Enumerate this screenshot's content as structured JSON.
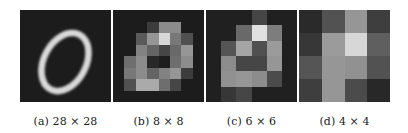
{
  "figure": {
    "panels": [
      {
        "id": "a",
        "caption": "(a) 28 × 28",
        "resolution": "28 × 28",
        "description": "Handwritten digit zero (MNIST-style) at full resolution"
      },
      {
        "id": "b",
        "caption": "(b) 8 × 8",
        "resolution": "8 × 8",
        "grid": [
          [
            28,
            28,
            28,
            28,
            28,
            28,
            28,
            28
          ],
          [
            28,
            28,
            28,
            60,
            140,
            140,
            28,
            28
          ],
          [
            28,
            28,
            90,
            150,
            215,
            120,
            80,
            28
          ],
          [
            28,
            28,
            130,
            100,
            70,
            105,
            150,
            28
          ],
          [
            28,
            110,
            140,
            40,
            30,
            110,
            140,
            28
          ],
          [
            28,
            120,
            140,
            100,
            130,
            150,
            60,
            28
          ],
          [
            28,
            80,
            170,
            170,
            110,
            70,
            28,
            28
          ],
          [
            28,
            28,
            28,
            28,
            28,
            28,
            28,
            28
          ]
        ]
      },
      {
        "id": "c",
        "caption": "(c) 6 × 6",
        "resolution": "6 × 6",
        "grid": [
          [
            32,
            32,
            32,
            70,
            32,
            32
          ],
          [
            32,
            32,
            105,
            225,
            125,
            32
          ],
          [
            32,
            85,
            165,
            80,
            155,
            32
          ],
          [
            32,
            140,
            70,
            70,
            150,
            32
          ],
          [
            32,
            145,
            150,
            140,
            75,
            32
          ],
          [
            32,
            55,
            70,
            32,
            32,
            32
          ]
        ]
      },
      {
        "id": "d",
        "caption": "(d) 4 × 4",
        "resolution": "4 × 4",
        "grid": [
          [
            42,
            82,
            150,
            62
          ],
          [
            55,
            155,
            215,
            95
          ],
          [
            85,
            150,
            145,
            82
          ],
          [
            62,
            150,
            75,
            40
          ]
        ]
      }
    ]
  }
}
